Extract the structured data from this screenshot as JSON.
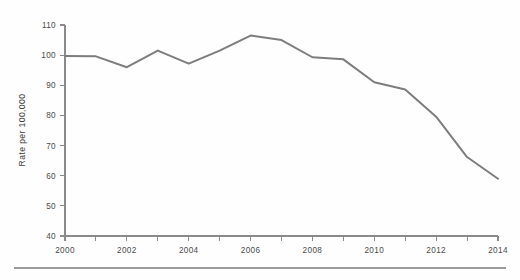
{
  "figure": {
    "background_color": "#fefefe",
    "footer_rule_color": "#9a9a9a"
  },
  "chart_data": {
    "type": "line",
    "title": "",
    "subtitle": "",
    "xlabel": "",
    "ylabel": "Rate per 100,000",
    "x": [
      2000,
      2001,
      2002,
      2003,
      2004,
      2005,
      2006,
      2007,
      2008,
      2009,
      2010,
      2011,
      2012,
      2013,
      2014
    ],
    "values": [
      99.7,
      99.6,
      96.0,
      101.5,
      97.2,
      101.5,
      106.5,
      105.0,
      99.3,
      98.6,
      91.0,
      88.6,
      79.6,
      66.2,
      59.0
    ],
    "series": [
      {
        "name": "Rate per 100,000",
        "color": "#7d7d7d",
        "values": [
          99.7,
          99.6,
          96.0,
          101.5,
          97.2,
          101.5,
          106.5,
          105.0,
          99.3,
          98.6,
          91.0,
          88.6,
          79.6,
          66.2,
          59.0
        ]
      }
    ],
    "xlim": [
      2000,
      2014
    ],
    "ylim": [
      40,
      110
    ],
    "xticks": [
      2000,
      2001,
      2002,
      2003,
      2004,
      2005,
      2006,
      2007,
      2008,
      2009,
      2010,
      2011,
      2012,
      2013,
      2014
    ],
    "xtick_labels": [
      "2000",
      "",
      "2002",
      "",
      "2004",
      "",
      "2006",
      "",
      "2008",
      "",
      "2010",
      "",
      "2012",
      "",
      "2014"
    ],
    "yticks": [
      40,
      50,
      60,
      70,
      80,
      90,
      100,
      110
    ],
    "ytick_labels": [
      "40",
      "50",
      "60",
      "70",
      "80",
      "90",
      "100",
      "110"
    ],
    "grid": false,
    "legend": false,
    "legend_position": "none",
    "annotations": [],
    "axis_color": "#8a8a8a",
    "tick_label_color": "#4a4a4a"
  }
}
